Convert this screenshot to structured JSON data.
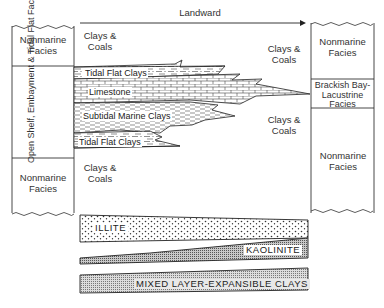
{
  "diagram": {
    "arrow": {
      "label": "Landward",
      "direction": "right"
    },
    "left_column": {
      "top": "Nonmarine Facies",
      "middle": "Open Shelf, Embayment & Tidal Flat Facies",
      "bottom": "Nonmarine Facies"
    },
    "right_column": {
      "top": "Nonmarine Facies",
      "middle": "Brackish Bay-Lacustrine Facies",
      "bottom": "Nonmarine Facies"
    },
    "fill_labels": {
      "top_left": "Clays & Coals",
      "bottom_left": "Clays & Coals",
      "top_right": "Clays & Coals",
      "bottom_right": "Clays & Coals"
    },
    "wedges": [
      {
        "label": "Tidal Flat Clays",
        "pattern": "dash-dot"
      },
      {
        "label": "Limestone",
        "pattern": "brick"
      },
      {
        "label": "Subtidal Marine Clays",
        "pattern": "dashed"
      },
      {
        "label": "Tidal Flat Clays",
        "pattern": "dash-dot"
      }
    ],
    "clay_minerals": [
      {
        "label": "ILLITE",
        "trend": "thins landward"
      },
      {
        "label": "KAOLINITE",
        "trend": "thickens landward"
      },
      {
        "label": "MIXED LAYER-EXPANSIBLE CLAYS",
        "trend": "thickens landward"
      }
    ]
  }
}
